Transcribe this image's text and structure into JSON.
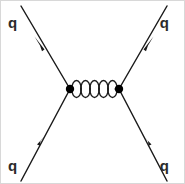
{
  "diagram": {
    "type": "feynman-diagram",
    "background_color": "#ffffff",
    "line_color": "#1a1a1a",
    "label_color": "#2b2b2b",
    "border_color": "#d8d8d8",
    "labels": {
      "top_left": "q",
      "top_right": "q",
      "bottom_left": "q",
      "bottom_right": "q"
    },
    "vertices": [
      {
        "name": "left-vertex",
        "x": 69,
        "y": 88,
        "radius": 4.2
      },
      {
        "name": "right-vertex",
        "x": 118,
        "y": 88,
        "radius": 4.2
      }
    ],
    "fermion_lines": [
      {
        "name": "incoming-quark-bottom-left",
        "from": [
          20,
          180
        ],
        "to": [
          69,
          88
        ],
        "arrow_direction": "toward-vertex",
        "arrow_at": [
          40.5,
          141.5
        ]
      },
      {
        "name": "outgoing-quark-top-left",
        "from": [
          69,
          88
        ],
        "to": [
          20,
          5
        ],
        "arrow_direction": "away-from-vertex",
        "arrow_at": [
          39,
          44
        ]
      },
      {
        "name": "incoming-quark-bottom-right",
        "from": [
          166,
          180
        ],
        "to": [
          118,
          88
        ],
        "arrow_direction": "toward-vertex",
        "arrow_at": [
          146,
          141
        ]
      },
      {
        "name": "outgoing-quark-top-right",
        "from": [
          118,
          88
        ],
        "to": [
          166,
          5
        ],
        "arrow_direction": "away-from-vertex",
        "arrow_at": [
          147,
          44
        ]
      }
    ],
    "gluon": {
      "name": "gluon-propagator",
      "style": "coil",
      "loops": 5,
      "from": [
        71,
        88
      ],
      "to": [
        116,
        88
      ],
      "amplitude": 8.5
    },
    "label_positions": {
      "top_left": [
        7,
        27
      ],
      "top_right": [
        168,
        27
      ],
      "bottom_left": [
        7,
        170
      ],
      "bottom_right": [
        168,
        170
      ]
    }
  }
}
